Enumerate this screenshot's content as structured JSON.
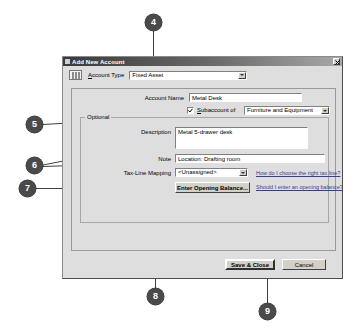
{
  "dialog": {
    "title": "Add New Account",
    "close_label": "×",
    "account_type": {
      "label": "Account Type",
      "value": "Fixed Asset",
      "icon": "account-ledger-icon"
    },
    "account_name": {
      "label": "Account Name",
      "value": "Metal Desk"
    },
    "subaccount": {
      "label": "Subaccount of",
      "checked": true,
      "value": "Furniture and Equipment"
    },
    "optional": {
      "legend": "Optional",
      "description": {
        "label": "Description",
        "value": "Metal 5-drawer desk"
      },
      "note": {
        "label": "Note",
        "value": "Location: Drafting room"
      },
      "tax_line_mapping": {
        "label": "Tax-Line Mapping",
        "value": "<Unassigned>",
        "help_link": "How do I choose the right tax line?"
      },
      "opening_balance": {
        "button_label": "Enter Opening Balance...",
        "help_link": "Should I enter an opening balance?"
      }
    },
    "buttons": {
      "save_close": "Save & Close",
      "cancel": "Cancel"
    }
  },
  "callouts": [
    {
      "id": "callout-4",
      "number": "4",
      "x": 145,
      "y": 14
    },
    {
      "id": "callout-5",
      "number": "5",
      "x": 26,
      "y": 116
    },
    {
      "id": "callout-6",
      "number": "6",
      "x": 26,
      "y": 157
    },
    {
      "id": "callout-7",
      "number": "7",
      "x": 19,
      "y": 180
    },
    {
      "id": "callout-8",
      "number": "8",
      "x": 147,
      "y": 288
    },
    {
      "id": "callout-9",
      "number": "9",
      "x": 259,
      "y": 303
    }
  ],
  "colors": {
    "callout_fill": "#4a4a4a",
    "callout_text": "#ffffff",
    "link": "#3b3b9a",
    "dialog_face": "#dedede",
    "titlebar_dark": "#3a3a3a"
  }
}
